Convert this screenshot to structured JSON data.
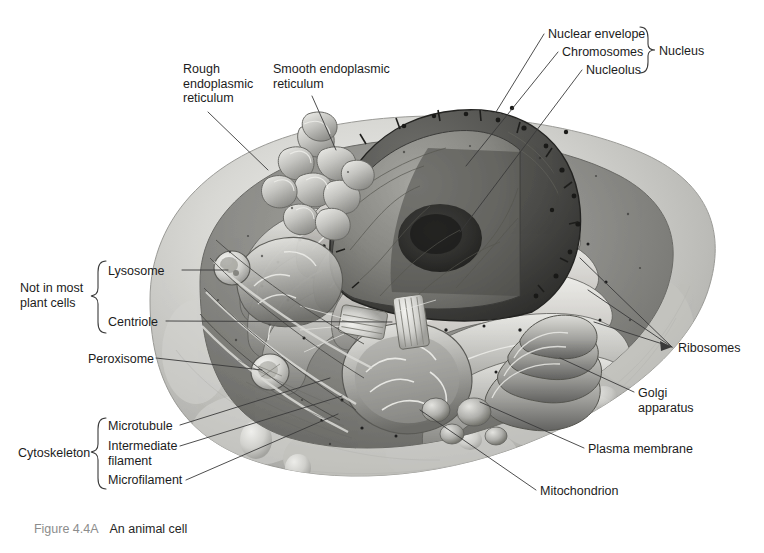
{
  "figure": {
    "number": "Figure 4.4A",
    "title": "An animal cell",
    "style": "grayscale textbook illustration"
  },
  "colors": {
    "background": "#ffffff",
    "label_text": "#1c1c1c",
    "caption_number": "#8c8c8c",
    "caption_title": "#262626",
    "leader_line": "#3a3a3a",
    "brace": "#3a3a3a",
    "membrane_outer": "#c9c9c6",
    "cytoplasm": "#8e8e8b",
    "nucleus_dark": "#4a4a48",
    "er_light": "#e6e6e2"
  },
  "labels": [
    {
      "id": "rough-er",
      "text": "Rough\nendoplasmic\nreticulum",
      "x": 183,
      "y": 62,
      "align": "left"
    },
    {
      "id": "smooth-er",
      "text": "Smooth endoplasmic\nreticulum",
      "x": 273,
      "y": 62,
      "align": "left"
    },
    {
      "id": "nuclear-envelope",
      "text": "Nuclear envelope",
      "x": 548,
      "y": 27,
      "align": "left"
    },
    {
      "id": "chromosomes",
      "text": "Chromosomes",
      "x": 562,
      "y": 45,
      "align": "left"
    },
    {
      "id": "nucleolus",
      "text": "Nucleolus",
      "x": 586,
      "y": 63,
      "align": "left"
    },
    {
      "id": "lysosome",
      "text": "Lysosome",
      "x": 108,
      "y": 264,
      "align": "left"
    },
    {
      "id": "centriole",
      "text": "Centriole",
      "x": 108,
      "y": 315,
      "align": "left"
    },
    {
      "id": "peroxisome",
      "text": "Peroxisome",
      "x": 88,
      "y": 352,
      "align": "left"
    },
    {
      "id": "microtubule",
      "text": "Microtubule",
      "x": 108,
      "y": 419,
      "align": "left"
    },
    {
      "id": "intermediate-filament",
      "text": "Intermediate\nfilament",
      "x": 108,
      "y": 440,
      "align": "left"
    },
    {
      "id": "microfilament",
      "text": "Microfilament",
      "x": 108,
      "y": 474,
      "align": "left"
    },
    {
      "id": "ribosomes",
      "text": "Ribosomes",
      "x": 678,
      "y": 341,
      "align": "left"
    },
    {
      "id": "golgi-apparatus",
      "text": "Golgi\napparatus",
      "x": 638,
      "y": 386,
      "align": "left"
    },
    {
      "id": "plasma-membrane",
      "text": "Plasma membrane",
      "x": 588,
      "y": 443,
      "align": "left"
    },
    {
      "id": "mitochondrion",
      "text": "Mitochondrion",
      "x": 540,
      "y": 485,
      "align": "left"
    }
  ],
  "group_labels": [
    {
      "id": "nucleus",
      "text": "Nucleus",
      "x": 674,
      "y": 44,
      "brace_x": 640,
      "brace_top": 26,
      "brace_bottom": 74,
      "brace_dir": "right"
    },
    {
      "id": "not-in-plant-cells",
      "text": "Not in most\nplant cells",
      "x": 20,
      "y": 281,
      "brace_x": 100,
      "brace_top": 260,
      "brace_bottom": 334,
      "brace_dir": "right"
    },
    {
      "id": "cytoskeleton",
      "text": "Cytoskeleton",
      "x": 18,
      "y": 446,
      "brace_x": 100,
      "brace_top": 417,
      "brace_bottom": 489,
      "brace_dir": "right"
    }
  ],
  "organelles": [
    "nucleus",
    "nucleolus",
    "chromosomes",
    "nuclear envelope",
    "rough endoplasmic reticulum",
    "smooth endoplasmic reticulum",
    "ribosomes",
    "golgi apparatus",
    "lysosome",
    "peroxisome",
    "centriole",
    "mitochondrion",
    "plasma membrane",
    "microtubule",
    "intermediate filament",
    "microfilament"
  ]
}
